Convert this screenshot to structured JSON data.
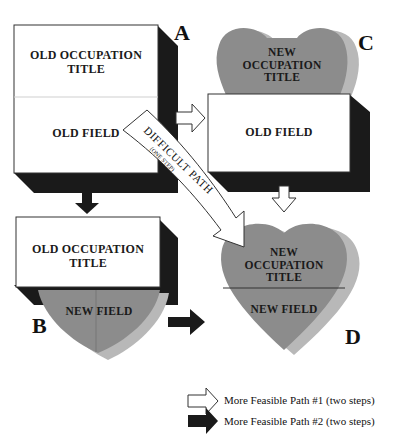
{
  "diagram": {
    "colors": {
      "heart_fill": "#8c8c8c",
      "heart_shadow": "#b8b8b8",
      "box_fill": "#ffffff",
      "box_shadow": "#1a1a1a",
      "arrow_white": "#ffffff",
      "arrow_black": "#1a1a1a"
    },
    "nodes": {
      "A": {
        "letter": "A",
        "top_label_line1": "OLD OCCUPATION",
        "top_label_line2": "TITLE",
        "bottom_label": "OLD FIELD"
      },
      "B": {
        "letter": "B",
        "top_label_line1": "OLD OCCUPATION",
        "top_label_line2": "TITLE",
        "bottom_label": "NEW FIELD"
      },
      "C": {
        "letter": "C",
        "top_label_line1": "NEW",
        "top_label_line2": "OCCUPATION",
        "top_label_line3": "TITLE",
        "bottom_label": "OLD FIELD"
      },
      "D": {
        "letter": "D",
        "top_label_line1": "NEW",
        "top_label_line2": "OCCUPATION",
        "top_label_line3": "TITLE",
        "bottom_label": "NEW FIELD"
      }
    },
    "difficult_path": {
      "label": "DIFFICULT PATH",
      "sublabel": "(ONE STEP)"
    },
    "legend": [
      {
        "icon": "white-arrow-icon",
        "label": "More Feasible Path #1 (two steps)"
      },
      {
        "icon": "black-arrow-icon",
        "label": "More Feasible Path #2 (two steps)"
      }
    ]
  }
}
